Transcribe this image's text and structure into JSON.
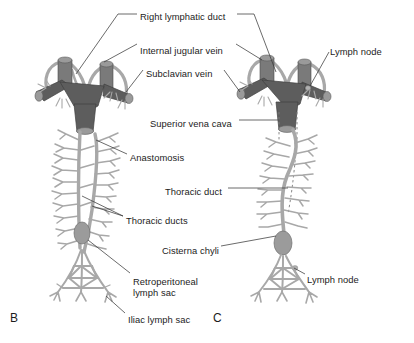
{
  "figure": {
    "kind": "anatomical-illustration",
    "panels": [
      {
        "id": "B",
        "letter": "B",
        "x": 10,
        "y": 311,
        "description": "Paired thoracic ducts with anastomosis, retroperitoneal and iliac lymph sacs"
      },
      {
        "id": "C",
        "letter": "C",
        "x": 213,
        "y": 311,
        "description": "Definitive single thoracic duct after regression of duct segments, with cisterna chyli"
      }
    ],
    "labels": [
      {
        "id": "right-lymphatic-duct",
        "text": "Right lymphatic duct",
        "x": 140,
        "y": 11,
        "align": "left"
      },
      {
        "id": "internal-jugular-vein",
        "text": "Internal jugular vein",
        "x": 140,
        "y": 45,
        "align": "left"
      },
      {
        "id": "subclavian-vein",
        "text": "Subclavian vein",
        "x": 146,
        "y": 68,
        "align": "left"
      },
      {
        "id": "lymph-node-top",
        "text": "Lymph node",
        "x": 330,
        "y": 46,
        "align": "left"
      },
      {
        "id": "superior-vena-cava",
        "text": "Superior vena cava",
        "x": 150,
        "y": 118,
        "align": "left"
      },
      {
        "id": "anastomosis",
        "text": "Anastomosis",
        "x": 130,
        "y": 152,
        "align": "left"
      },
      {
        "id": "thoracic-duct",
        "text": "Thoracic duct",
        "x": 165,
        "y": 186,
        "align": "left"
      },
      {
        "id": "thoracic-ducts",
        "text": "Thoracic ducts",
        "x": 126,
        "y": 215,
        "align": "left"
      },
      {
        "id": "cisterna-chyli",
        "text": "Cisterna chyli",
        "x": 162,
        "y": 245,
        "align": "left"
      },
      {
        "id": "retroperitoneal-lymph-sac-line1",
        "text": "Retroperitoneal",
        "x": 133,
        "y": 276,
        "align": "left"
      },
      {
        "id": "retroperitoneal-lymph-sac-line2",
        "text": "lymph sac",
        "x": 133,
        "y": 287,
        "align": "left"
      },
      {
        "id": "iliac-lymph-sac",
        "text": "Iliac lymph sac",
        "x": 128,
        "y": 314,
        "align": "left"
      },
      {
        "id": "lymph-node-bottom",
        "text": "Lymph node",
        "x": 307,
        "y": 274,
        "align": "left"
      }
    ],
    "colors": {
      "vein_dark": "#5d5d5d",
      "vein_mid": "#7a7a7a",
      "vein_light": "#9a9a9a",
      "lymph_light": "#b3b3b3",
      "lymph_mid": "#a0a0a0",
      "sac_fill": "#9b9b9b",
      "outline": "#4a4a4a",
      "leader_line": "#3a3a3a",
      "text": "#1c1c1c",
      "background": "#ffffff"
    }
  }
}
